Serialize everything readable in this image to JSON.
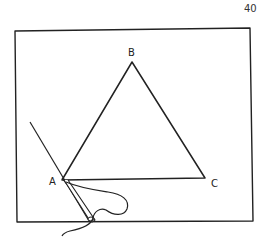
{
  "page_number": "40",
  "figure": {
    "labels": {
      "a": "A",
      "b": "B",
      "c": "C"
    },
    "stroke_color": "#222222",
    "background_color": "#ffffff"
  }
}
